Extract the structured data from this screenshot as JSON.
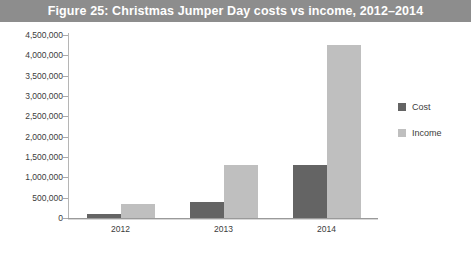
{
  "figure": {
    "caption": "Figure 25: Christmas Jumper Day costs vs income, 2012–2014",
    "bar_color": "#8d8d8d"
  },
  "legend": {
    "position": "right",
    "entries": [
      {
        "label": "Cost",
        "color": "#646464",
        "swatch_icon": "square-swatch-icon"
      },
      {
        "label": "Income",
        "color": "#bfbfbf",
        "swatch_icon": "square-swatch-icon"
      }
    ]
  },
  "axes": {
    "y_ticks": [
      "4,500,000",
      "4,000,000",
      "3,500,000",
      "3,000,000",
      "2,500,000",
      "2,000,000",
      "1,500,000",
      "1,000,000",
      "500,000",
      "0"
    ],
    "x_ticks": [
      "2012",
      "2013",
      "2014"
    ]
  },
  "chart_data": {
    "type": "bar",
    "title": "Figure 25: Christmas Jumper Day costs vs income, 2012–2014",
    "xlabel": "",
    "ylabel": "",
    "categories": [
      "2012",
      "2013",
      "2014"
    ],
    "series": [
      {
        "name": "Cost",
        "color": "#646464",
        "values": [
          100000,
          400000,
          1300000
        ]
      },
      {
        "name": "Income",
        "color": "#bfbfbf",
        "values": [
          350000,
          1300000,
          4250000
        ]
      }
    ],
    "ylim": [
      0,
      4500000
    ],
    "ytick_step": 500000,
    "ytick_values": [
      0,
      500000,
      1000000,
      1500000,
      2000000,
      2500000,
      3000000,
      3500000,
      4000000,
      4500000
    ],
    "grid": false,
    "legend_position": "right",
    "value_labels_shown": false
  }
}
